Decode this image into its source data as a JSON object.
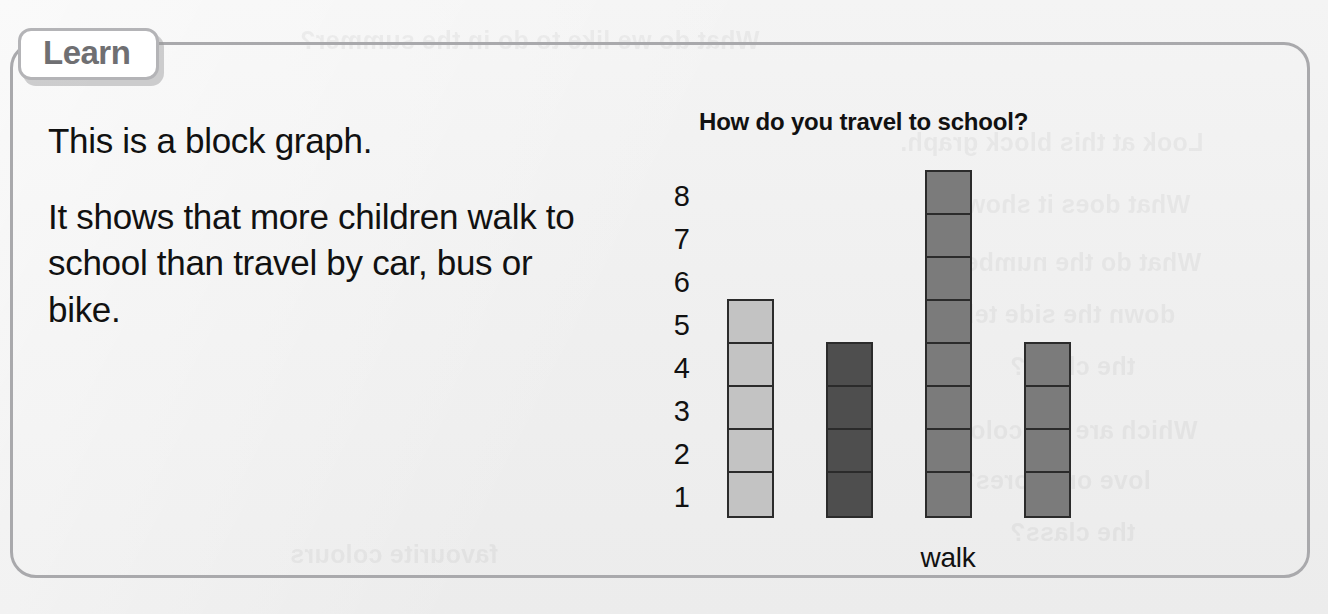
{
  "panel": {
    "tab_label": "Learn"
  },
  "prose": {
    "paragraphs": [
      "This is a block graph.",
      "It shows that more children walk to school than travel by car, bus or bike."
    ]
  },
  "ghost_text": {
    "lines": [
      "What do we like to do in the summer?",
      "Look at this block graph.",
      "What does it show?",
      "What do the numbers",
      "down the side tell",
      "the class?",
      "Which are the colours",
      "love or adores?",
      "the class?",
      "favourite colours"
    ]
  },
  "chart_data": {
    "type": "bar",
    "title": "How do you travel to school?",
    "xlabel": "",
    "ylabel": "",
    "categories": [
      "bus",
      "car",
      "walk",
      "bike"
    ],
    "values": [
      5,
      4,
      8,
      4
    ],
    "block_colors": [
      "#c3c3c3",
      "#4e4e4e",
      "#7b7b7b",
      "#7b7b7b"
    ],
    "block_outline_color": "#2b2b2b",
    "y_ticks": [
      8,
      7,
      6,
      5,
      4,
      3,
      2,
      1
    ],
    "ylim": [
      0,
      8
    ],
    "grid": false,
    "legend": "none",
    "note": "Block graph: each block represents one child."
  },
  "colors": {
    "page_background": "#f1f1f1",
    "panel_border": "#a9a9ac",
    "tab_text": "#6f6f72",
    "text": "#111111"
  }
}
